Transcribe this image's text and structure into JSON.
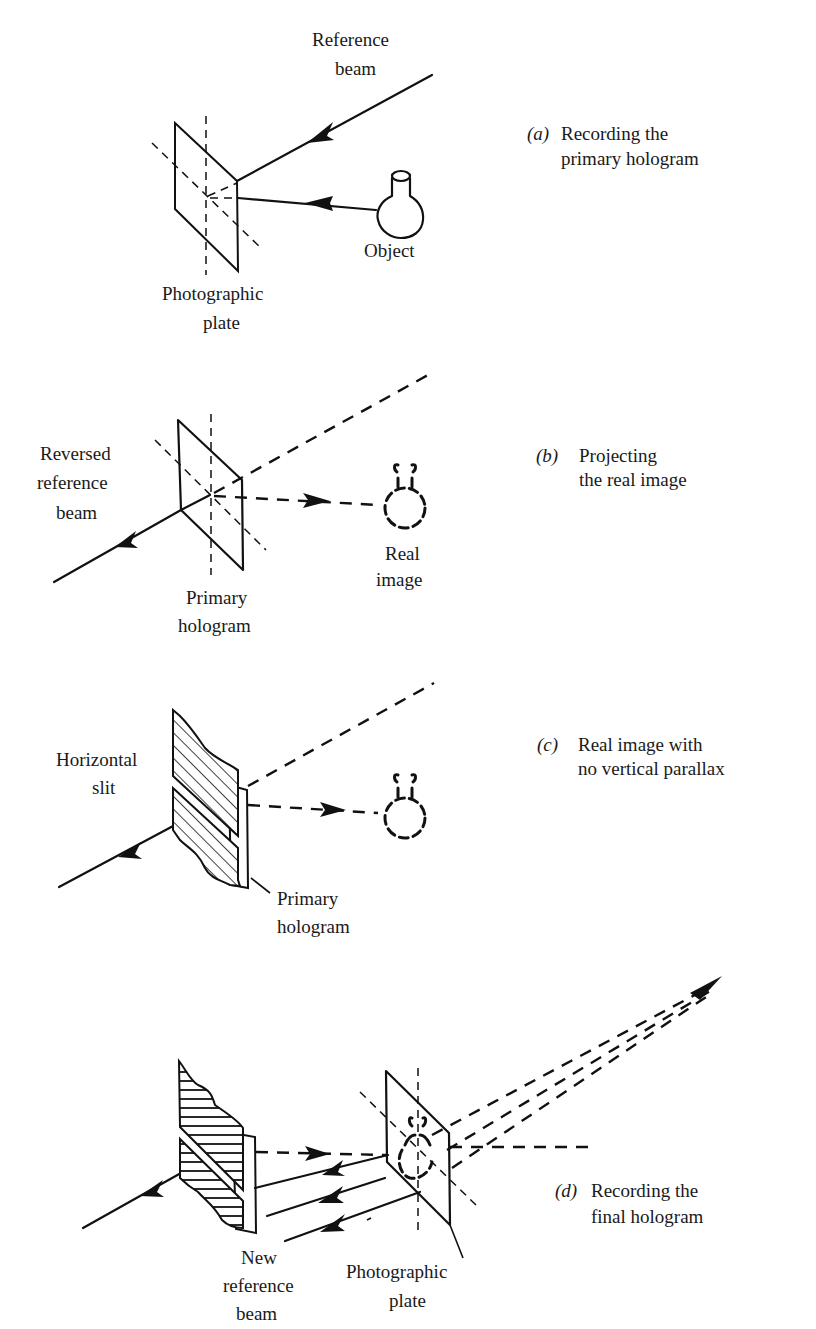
{
  "figure": {
    "header_fragment": "",
    "panels": [
      {
        "id": "a",
        "letter": "(a)",
        "caption_line1": "Recording the",
        "caption_line2": "primary hologram",
        "labels": {
          "reference_beam_1": "Reference",
          "reference_beam_2": "beam",
          "object": "Object",
          "plate_1": "Photographic",
          "plate_2": "plate"
        }
      },
      {
        "id": "b",
        "letter": "(b)",
        "caption_line1": "Projecting",
        "caption_line2": "the real image",
        "labels": {
          "reversed_1": "Reversed",
          "reversed_2": "reference",
          "reversed_3": "beam",
          "real_image_1": "Real",
          "real_image_2": "image",
          "primary_1": "Primary",
          "primary_2": "hologram"
        }
      },
      {
        "id": "c",
        "letter": "(c)",
        "caption_line1": "Real image with",
        "caption_line2": "no vertical parallax",
        "labels": {
          "slit_1": "Horizontal",
          "slit_2": "slit",
          "primary_1": "Primary",
          "primary_2": "hologram"
        }
      },
      {
        "id": "d",
        "letter": "(d)",
        "caption_line1": "Recording the",
        "caption_line2": "final hologram",
        "labels": {
          "new_ref_1": "New",
          "new_ref_2": "reference",
          "new_ref_3": "beam",
          "plate_1": "Photographic",
          "plate_2": "plate"
        }
      }
    ]
  }
}
